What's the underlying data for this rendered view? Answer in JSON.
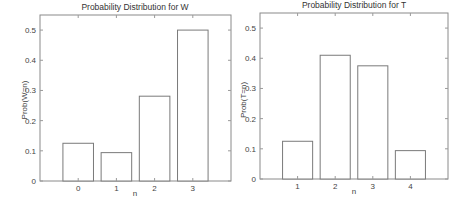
{
  "chart_data": [
    {
      "type": "bar",
      "title": "Probability Distribution for W",
      "xlabel": "n",
      "ylabel": "Prob(W=n)",
      "categories": [
        "0",
        "1",
        "2",
        "3"
      ],
      "values": [
        0.125,
        0.094,
        0.281,
        0.5
      ],
      "ylim": [
        0,
        0.55
      ],
      "xlim": [
        -1,
        4
      ],
      "yticks": [
        0,
        0.1,
        0.2,
        0.3,
        0.4,
        0.5
      ],
      "ytick_labels": [
        "0",
        "0.1",
        "0.2",
        "0.3",
        "0.4",
        "0.5"
      ],
      "grid": false
    },
    {
      "type": "bar",
      "title": "Probability Distribution for T",
      "xlabel": "n",
      "ylabel": "Prob(T=n)",
      "categories": [
        "1",
        "2",
        "3",
        "4"
      ],
      "values": [
        0.125,
        0.41,
        0.375,
        0.094
      ],
      "ylim": [
        0,
        0.55
      ],
      "xlim": [
        0,
        5
      ],
      "yticks": [
        0,
        0.1,
        0.2,
        0.3,
        0.4,
        0.5
      ],
      "ytick_labels": [
        "0",
        "0.1",
        "0.2",
        "0.3",
        "0.4",
        "0.5"
      ],
      "grid": false
    }
  ]
}
